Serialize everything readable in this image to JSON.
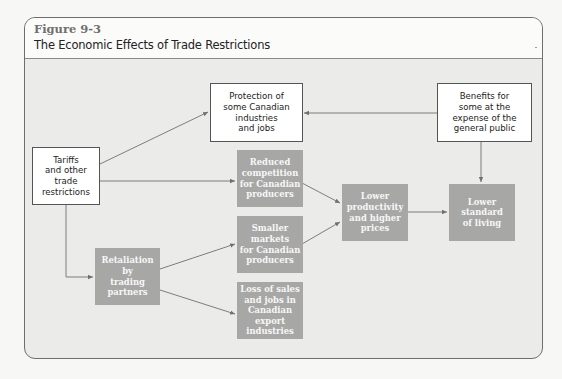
{
  "figure": {
    "number": "Figure 9-3",
    "title": "The Economic Effects of Trade Restrictions"
  },
  "colors": {
    "background": "#ebebea",
    "header": "#fbfbfa",
    "shaded_box": "#a7a7a6",
    "outline_box": "#ffffff",
    "arrow": "#707070"
  },
  "nodes": {
    "tariffs": "Tariffs\nand other\ntrade\nrestrictions",
    "protection": "Protection of\nsome Canadian\nindustries\nand jobs",
    "benefits": "Benefits for\nsome at the\nexpense of the\ngeneral public",
    "reduced_competition": "Reduced\ncompetition\nfor Canadian\nproducers",
    "smaller_markets": "Smaller markets\nfor Canadian\nproducers",
    "retaliation": "Retaliation\nby\ntrading\npartners",
    "loss_of_sales": "Loss of sales\nand jobs in\nCanadian export\nindustries",
    "lower_productivity": "Lower\nproductivity\nand higher\nprices",
    "lower_standard": "Lower\nstandard\nof living"
  },
  "edges": [
    {
      "from": "tariffs",
      "to": "protection"
    },
    {
      "from": "tariffs",
      "to": "reduced_competition"
    },
    {
      "from": "tariffs",
      "to": "retaliation"
    },
    {
      "from": "benefits",
      "to": "protection"
    },
    {
      "from": "benefits",
      "to": "lower_standard"
    },
    {
      "from": "reduced_competition",
      "to": "lower_productivity"
    },
    {
      "from": "smaller_markets",
      "to": "lower_productivity"
    },
    {
      "from": "retaliation",
      "to": "smaller_markets"
    },
    {
      "from": "retaliation",
      "to": "loss_of_sales"
    },
    {
      "from": "lower_productivity",
      "to": "lower_standard"
    }
  ]
}
